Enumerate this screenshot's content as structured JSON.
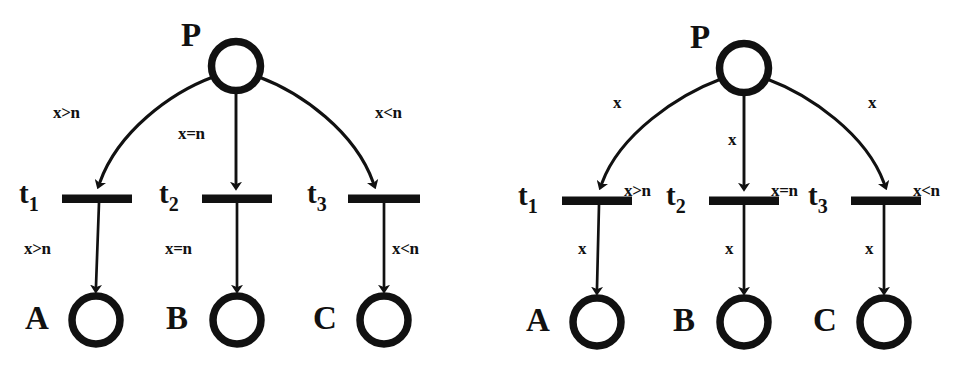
{
  "figure": {
    "background_color": "#ffffff",
    "ink_color": "#111111",
    "panels": [
      {
        "id": "left",
        "name": "guard-on-arcs-variant",
        "place_source": {
          "label": "P"
        },
        "transitions": [
          {
            "label": "t",
            "sub": "1"
          },
          {
            "label": "t",
            "sub": "2"
          },
          {
            "label": "t",
            "sub": "3"
          }
        ],
        "places_sink": [
          {
            "label": "A"
          },
          {
            "label": "B"
          },
          {
            "label": "C"
          }
        ],
        "input_arc_labels": [
          "x>n",
          "x=n",
          "x<n"
        ],
        "output_arc_labels": [
          "x>n",
          "x=n",
          "x<n"
        ]
      },
      {
        "id": "right",
        "name": "guard-on-transitions-variant",
        "place_source": {
          "label": "P"
        },
        "transitions": [
          {
            "label": "t",
            "sub": "1"
          },
          {
            "label": "t",
            "sub": "2"
          },
          {
            "label": "t",
            "sub": "3"
          }
        ],
        "places_sink": [
          {
            "label": "A"
          },
          {
            "label": "B"
          },
          {
            "label": "C"
          }
        ],
        "input_arc_labels": [
          "x",
          "x",
          "x"
        ],
        "output_arc_labels": [
          "x",
          "x",
          "x"
        ],
        "guard_labels": [
          "x>n",
          "x=n",
          "x<n"
        ]
      }
    ]
  }
}
